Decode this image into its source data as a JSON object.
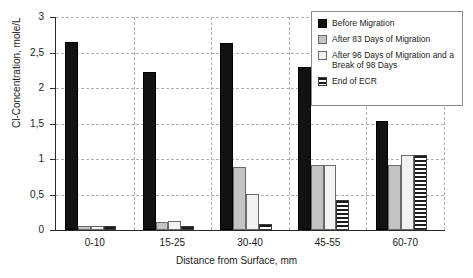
{
  "chart_data": {
    "type": "bar",
    "title": "",
    "subtitle": "",
    "xlabel": "Distance from Surface, mm",
    "ylabel": "Cl-Concentration, mole/L",
    "categories": [
      "0-10",
      "15-25",
      "30-40",
      "45-55",
      "60-70"
    ],
    "ylim": [
      0,
      3
    ],
    "yticks": [
      0,
      0.5,
      1,
      1.5,
      2,
      2.5,
      3
    ],
    "ytick_labels": [
      "0",
      "0,5",
      "1",
      "1,5",
      "2",
      "2,5",
      "3"
    ],
    "grid": "horizontal-dashed-and-vertical-category-separators",
    "legend_position": "top-right-inside",
    "series": [
      {
        "name": "Before Migration",
        "color": "#121212",
        "pattern": "solid",
        "values": [
          2.65,
          2.23,
          2.63,
          2.3,
          1.54
        ]
      },
      {
        "name": "After 83 Days of Migration",
        "color": "#c3c3c3",
        "pattern": "solid",
        "values": [
          0.05,
          0.11,
          0.89,
          0.92,
          0.92
        ]
      },
      {
        "name": "After 96 Days of Migration and a Break of 98 Days",
        "color": "#f2f2f2",
        "pattern": "solid",
        "values": [
          0.06,
          0.13,
          0.51,
          0.91,
          1.05
        ]
      },
      {
        "name": "End of ECR",
        "color": "#1c1c1c",
        "pattern": "horizontal-stripes",
        "values": [
          0.05,
          0.05,
          0.09,
          0.42,
          1.05
        ]
      }
    ]
  },
  "legend": {
    "items": [
      {
        "label": "Before Migration",
        "swatch": "solid-black-swatch"
      },
      {
        "label": "After 83 Days of Migration",
        "swatch": "solid-gray-swatch"
      },
      {
        "label": "After 96 Days of Migration and a Break of 98 Days",
        "swatch": "solid-white-swatch"
      },
      {
        "label": "End of ECR",
        "swatch": "striped-swatch"
      }
    ]
  }
}
